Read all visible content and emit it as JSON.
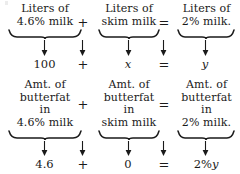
{
  "figure": {
    "type": "mixture-equation-diagram",
    "ink_color": "#1a1a1a",
    "background_color": "#ffffff"
  },
  "row1": {
    "term1": {
      "lines": [
        "Liters of",
        "4.6% milk"
      ]
    },
    "operator1": "+",
    "term2": {
      "lines": [
        "Liters of",
        "skim milk"
      ]
    },
    "operator2": "=",
    "term3": {
      "lines": [
        "Liters of",
        "2% milk."
      ]
    }
  },
  "row1_values": {
    "value1": "100",
    "operator1": "+",
    "value2": "x",
    "operator2": "=",
    "value3": "y"
  },
  "row2": {
    "term1": {
      "lines": [
        "Amt. of",
        "butterfat",
        "in",
        "4.6% milk"
      ]
    },
    "operator1": "+",
    "term2": {
      "lines": [
        "Amt. of",
        "butterfat",
        "in",
        "skim milk"
      ]
    },
    "operator2": "=",
    "term3": {
      "lines": [
        "Amt. of",
        "butterfat",
        "in",
        "2% milk."
      ]
    }
  },
  "row2_values": {
    "value1": "4.6",
    "operator1": "+",
    "value2": "0",
    "operator2": "=",
    "value3_prefix": "2%",
    "value3_var": "y"
  },
  "arrows": {
    "glyph": "down-arrow",
    "count": 8
  },
  "braces": {
    "glyph": "underbrace",
    "count": 6
  }
}
